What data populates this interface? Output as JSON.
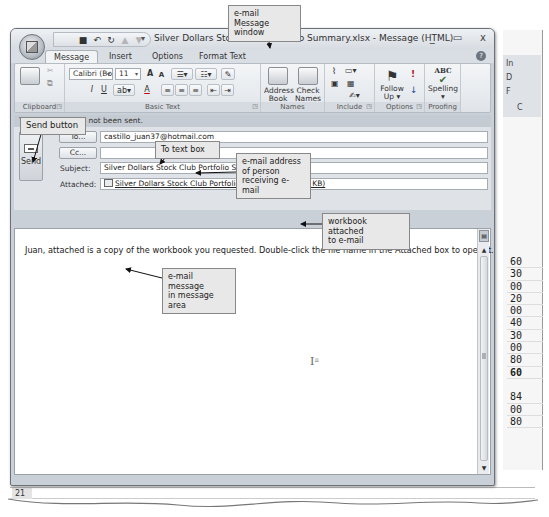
{
  "window": {
    "title": "Silver Dollars Stock Club Portfolio Summary.xlsx - Message (HTML)",
    "controls": {
      "minimize": "_",
      "restore": "▭",
      "close": "x"
    }
  },
  "quick_access": {
    "items": [
      {
        "name": "save-icon",
        "glyph": "■"
      },
      {
        "name": "undo-icon",
        "glyph": "↶"
      },
      {
        "name": "redo-icon",
        "glyph": "↻"
      },
      {
        "name": "previous-item-icon",
        "glyph": "▲"
      },
      {
        "name": "next-item-icon",
        "glyph": "▼"
      }
    ],
    "customize": "▾"
  },
  "tabs": [
    {
      "label": "Message",
      "active": true
    },
    {
      "label": "Insert",
      "active": false
    },
    {
      "label": "Options",
      "active": false
    },
    {
      "label": "Format Text",
      "active": false
    }
  ],
  "ribbon": {
    "groups": {
      "clipboard": "Clipboard",
      "basic_text": "Basic Text",
      "names": "Names",
      "include": "Include",
      "options": "Options",
      "proofing": "Proofing"
    },
    "font_name": "Calibri (Bo",
    "font_size": "11",
    "grow_font": "A",
    "shrink_font": "A",
    "bold": "B",
    "italic": "I",
    "underline": "U",
    "font_color": "A",
    "address_book": "Address Book",
    "address_book_l1": "Address",
    "address_book_l2": "Book",
    "check_names_l1": "Check",
    "check_names_l2": "Names",
    "follow_up_l1": "Follow",
    "follow_up_l2": "Up ▾",
    "high_importance": "!",
    "low_importance": "↓",
    "spelling": "Spelling",
    "spelling_dd": "▾",
    "spelling_icon": "ABC"
  },
  "header": {
    "info": "This message has not been sent.",
    "send_label": "Send",
    "to_button": "To...",
    "cc_button": "Cc...",
    "to_value": "castillo_juan37@hotmail.com",
    "cc_value": "",
    "subject_label": "Subject:",
    "subject_value": "Silver Dollars Stock Club Portfolio Summary.xlsx",
    "attached_label": "Attached:",
    "attached_value": "Silver Dollars Stock Club Portfolio Summary.xlsx (29 KB)"
  },
  "message": {
    "body": "Juan, attached is a copy of the workbook you requested. Double-click the file name in the Attached box to open it."
  },
  "callouts": {
    "window": "e-mail Message window",
    "window_l1": "e-mail Message",
    "window_l2": "window",
    "send_button": "Send button",
    "to_text_box": "To text box",
    "email_l1": "e-mail address",
    "email_l2": "of person",
    "email_l3": "receiving e-mail",
    "attached_l1": "workbook attached",
    "attached_l2": "to e-mail",
    "message_l1": "e-mail message",
    "message_l2": "in message area"
  },
  "background_excel": {
    "ribbon_items": [
      "In",
      "D",
      "F",
      "C"
    ],
    "column_values": [
      "60",
      "30",
      "00",
      "20",
      "00",
      "40",
      "30",
      "00",
      "80",
      "60",
      "",
      "84",
      "00",
      "80"
    ],
    "row_number": "21"
  }
}
